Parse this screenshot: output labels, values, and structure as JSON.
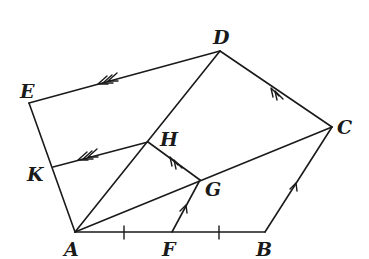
{
  "figure": {
    "stroke_color": "#1a1a1a",
    "background": "#ffffff"
  },
  "points": {
    "A": {
      "label": "A",
      "x": 75,
      "y": 232
    },
    "F": {
      "label": "F",
      "x": 172,
      "y": 232
    },
    "B": {
      "label": "B",
      "x": 265,
      "y": 232
    },
    "C": {
      "label": "C",
      "x": 332,
      "y": 127
    },
    "D": {
      "label": "D",
      "x": 220,
      "y": 51
    },
    "E": {
      "label": "E",
      "x": 29,
      "y": 103
    },
    "K": {
      "label": "K",
      "x": 53,
      "y": 167
    },
    "H": {
      "label": "H",
      "x": 148,
      "y": 142
    },
    "G": {
      "label": "G",
      "x": 200,
      "y": 180
    }
  },
  "segments": [
    {
      "from": "A",
      "to": "B"
    },
    {
      "from": "B",
      "to": "C"
    },
    {
      "from": "C",
      "to": "D"
    },
    {
      "from": "D",
      "to": "E"
    },
    {
      "from": "E",
      "to": "A"
    },
    {
      "from": "A",
      "to": "D"
    },
    {
      "from": "A",
      "to": "C"
    },
    {
      "from": "K",
      "to": "H"
    },
    {
      "from": "H",
      "to": "G"
    },
    {
      "from": "F",
      "to": "G"
    }
  ],
  "annotations": {
    "equal_ticks": [
      "AF",
      "FB"
    ],
    "single_arrow_parallel": [
      "FG",
      "BC"
    ],
    "double_arrow_parallel": [
      "GH",
      "CD"
    ],
    "triple_arrow_parallel": [
      "KH",
      "ED"
    ]
  }
}
